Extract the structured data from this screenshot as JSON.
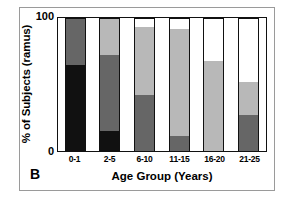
{
  "figure": {
    "panel_label": "B",
    "axis": {
      "ylabel": "% of Subjects (ramus)",
      "xlabel": "Age Group (Years)",
      "ytick_top": "100",
      "ytick_bottom": "0"
    }
  },
  "chart_data": {
    "type": "bar",
    "subtype": "stacked-100-percent",
    "title": "",
    "panel": "B",
    "xlabel": "Age Group (Years)",
    "ylabel": "% of Subjects (ramus)",
    "ylim": [
      0,
      100
    ],
    "yticks": [
      0,
      100
    ],
    "grid": false,
    "legend": null,
    "categories": [
      "0-1",
      "2-5",
      "6-10",
      "11-15",
      "16-20",
      "21-25"
    ],
    "series": [
      {
        "name": "black",
        "color": "#111111",
        "values": [
          65,
          15,
          0,
          0,
          0,
          0
        ]
      },
      {
        "name": "dark-gray",
        "color": "#666666",
        "values": [
          35,
          57,
          42,
          11,
          0,
          27
        ]
      },
      {
        "name": "light-gray",
        "color": "#b8b8b8",
        "values": [
          0,
          28,
          51,
          81,
          68,
          25
        ]
      },
      {
        "name": "white",
        "color": "#ffffff",
        "values": [
          0,
          0,
          7,
          8,
          32,
          48
        ]
      }
    ],
    "stack_order": "bottom-to-top: black, dark-gray, light-gray, white"
  },
  "colors": {
    "black": "#111111",
    "dark_gray": "#666666",
    "light_gray": "#b8b8b8",
    "white": "#ffffff",
    "axis": "#111111",
    "frame": "#9a9a9a"
  }
}
